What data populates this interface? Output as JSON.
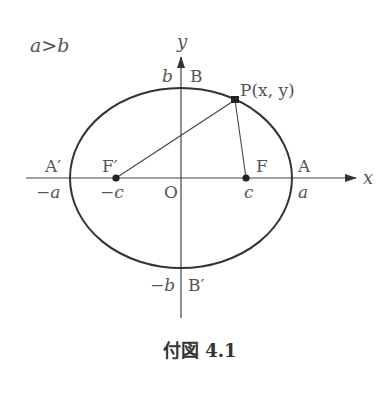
{
  "figure": {
    "condition": "a>b",
    "caption": "付図 4.1",
    "axes": {
      "x_label": "x",
      "y_label": "y",
      "origin_label": "O"
    },
    "points": {
      "A": "A",
      "A_prime": "A′",
      "B": "B",
      "B_prime": "B′",
      "F": "F",
      "F_prime": "F′",
      "P": "P(x, y)"
    },
    "ticks": {
      "pos_a": "a",
      "neg_a": "−a",
      "pos_c": "c",
      "neg_c": "−c",
      "pos_b": "b",
      "neg_b": "−b"
    },
    "colors": {
      "stroke": "#333333",
      "label": "#555555"
    }
  }
}
